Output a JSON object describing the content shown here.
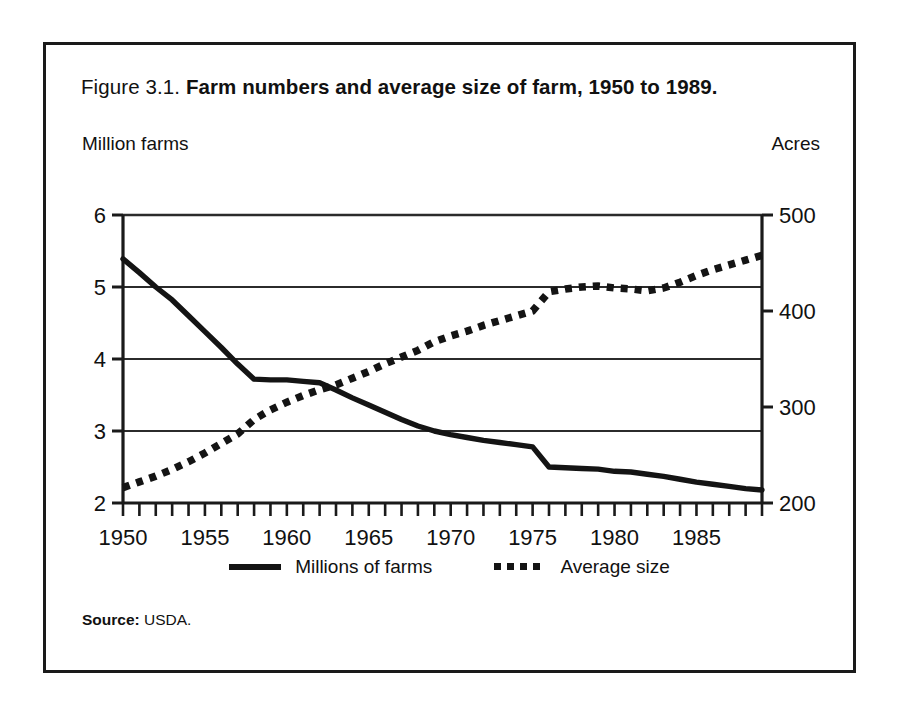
{
  "figure": {
    "title_number": "Figure 3.1.",
    "title_main": "Farm numbers and average size of farm, 1950 to 1989.",
    "left_axis_title": "Million farms",
    "right_axis_title": "Acres",
    "source_label": "Source:",
    "source_value": "USDA."
  },
  "legend": {
    "items": [
      {
        "label": "Millions of farms",
        "style": "solid"
      },
      {
        "label": "Average size",
        "style": "dotted"
      }
    ]
  },
  "colors": {
    "ink": "#141414",
    "frame": "#1a1a1a",
    "gridline": "#2b2b2b",
    "background": "#ffffff"
  },
  "chart_data": {
    "type": "line",
    "title": "Farm numbers and average size of farm, 1950 to 1989.",
    "xlabel": "",
    "ylabel": "Million farms",
    "y2label": "Acres",
    "xlim": [
      1950,
      1989
    ],
    "ylim": [
      2,
      6
    ],
    "y2lim": [
      200,
      500
    ],
    "yticks": [
      2,
      3,
      4,
      5,
      6
    ],
    "y2ticks": [
      200,
      300,
      400,
      500
    ],
    "xticks": [
      1950,
      1955,
      1960,
      1965,
      1970,
      1975,
      1980,
      1985
    ],
    "xtick_labels": [
      "1950",
      "1955",
      "1960",
      "1965",
      "1970",
      "1975",
      "1980",
      "1985"
    ],
    "ytick_labels": [
      "2",
      "3",
      "4",
      "5",
      "6"
    ],
    "y2tick_labels": [
      "200",
      "300",
      "400",
      "500"
    ],
    "x_minor_tick_step": 1,
    "grid": "horizontal",
    "legend_position": "bottom-center",
    "x": [
      1950,
      1951,
      1952,
      1953,
      1954,
      1955,
      1956,
      1957,
      1958,
      1959,
      1960,
      1961,
      1962,
      1963,
      1964,
      1965,
      1966,
      1967,
      1968,
      1969,
      1970,
      1971,
      1972,
      1973,
      1974,
      1975,
      1976,
      1977,
      1978,
      1979,
      1980,
      1981,
      1982,
      1983,
      1984,
      1985,
      1986,
      1987,
      1988,
      1989
    ],
    "series": [
      {
        "name": "Millions of farms",
        "axis": "left",
        "style": "solid",
        "units": "million farms",
        "values": [
          5.39,
          5.2,
          5.0,
          4.82,
          4.6,
          4.38,
          4.16,
          3.93,
          3.72,
          3.71,
          3.71,
          3.69,
          3.67,
          3.57,
          3.46,
          3.36,
          3.26,
          3.16,
          3.07,
          3.0,
          2.95,
          2.91,
          2.87,
          2.84,
          2.81,
          2.78,
          2.5,
          2.49,
          2.48,
          2.47,
          2.44,
          2.43,
          2.4,
          2.37,
          2.33,
          2.29,
          2.26,
          2.23,
          2.2,
          2.18
        ]
      },
      {
        "name": "Average size",
        "axis": "right",
        "style": "dotted",
        "units": "acres",
        "values": [
          216,
          222,
          228,
          235,
          243,
          252,
          262,
          272,
          287,
          297,
          305,
          312,
          318,
          323,
          330,
          337,
          345,
          352,
          359,
          368,
          374,
          379,
          385,
          390,
          395,
          400,
          420,
          423,
          425,
          426,
          424,
          423,
          421,
          424,
          430,
          437,
          443,
          448,
          453,
          458
        ]
      }
    ]
  }
}
